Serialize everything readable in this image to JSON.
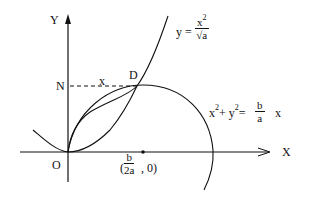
{
  "diagram": {
    "axes": {
      "x_label": "X",
      "y_label": "Y",
      "origin_label": "O"
    },
    "points": {
      "n_label": "N",
      "d_label": "D",
      "segment_label": "x",
      "center_open": "(",
      "center_num": "b",
      "center_den": "2a",
      "center_close": ",  0)"
    },
    "parabola": {
      "lhs": "y =",
      "num": "x",
      "num_exp": "2",
      "den_root": "√",
      "den": "a"
    },
    "circle": {
      "x_term": "x",
      "x_exp": "2",
      "plus": "+ y",
      "y_exp": "2",
      "eq": "=",
      "num": "b",
      "den": "a",
      "tail": "x"
    },
    "colors": {
      "stroke": "#111111",
      "background": "#ffffff"
    }
  }
}
